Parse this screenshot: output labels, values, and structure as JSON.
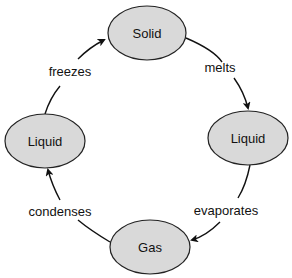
{
  "diagram": {
    "type": "cycle",
    "colors": {
      "node_fill": "#d9d9d9",
      "node_stroke": "#222222",
      "arrow": "#111111",
      "text": "#111111",
      "background": "#ffffff"
    },
    "nodes": [
      {
        "id": "solid",
        "label": "Solid"
      },
      {
        "id": "liquid_right",
        "label": "Liquid"
      },
      {
        "id": "gas",
        "label": "Gas"
      },
      {
        "id": "liquid_left",
        "label": "Liquid"
      }
    ],
    "edges": [
      {
        "from": "solid",
        "to": "liquid_right",
        "label": "melts"
      },
      {
        "from": "liquid_right",
        "to": "gas",
        "label": "evaporates"
      },
      {
        "from": "gas",
        "to": "liquid_left",
        "label": "condenses"
      },
      {
        "from": "liquid_left",
        "to": "solid",
        "label": "freezes"
      }
    ]
  }
}
